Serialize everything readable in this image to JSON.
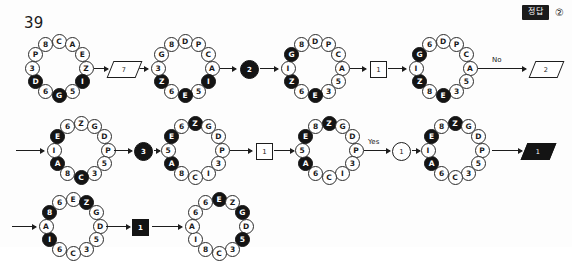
{
  "page": {
    "question_number": "39",
    "answer_badge_label": "정답",
    "answer_choice": "②"
  },
  "colors": {
    "ink": "#1a1a1a",
    "node_fill_dark": "#141414",
    "node_fill_light": "#ffffff",
    "page_background": "#fdfdfd"
  },
  "labels": {
    "branch_no": "No",
    "branch_yes": "Yes"
  },
  "rings": [
    {
      "id": "ring-1",
      "row": 1,
      "x": 26,
      "nodes": [
        {
          "label": "C",
          "filled": false
        },
        {
          "label": "A",
          "filled": false
        },
        {
          "label": "E",
          "filled": false
        },
        {
          "label": "Z",
          "filled": false
        },
        {
          "label": "I",
          "filled": true
        },
        {
          "label": "5",
          "filled": false
        },
        {
          "label": "G",
          "filled": true
        },
        {
          "label": "6",
          "filled": false
        },
        {
          "label": "D",
          "filled": true
        },
        {
          "label": "3",
          "filled": false
        },
        {
          "label": "P",
          "filled": false
        },
        {
          "label": "8",
          "filled": false
        }
      ]
    },
    {
      "id": "ring-2",
      "row": 1,
      "x": 152,
      "nodes": [
        {
          "label": "D",
          "filled": false
        },
        {
          "label": "P",
          "filled": false
        },
        {
          "label": "C",
          "filled": false
        },
        {
          "label": "A",
          "filled": false
        },
        {
          "label": "I",
          "filled": true
        },
        {
          "label": "5",
          "filled": false
        },
        {
          "label": "E",
          "filled": true
        },
        {
          "label": "6",
          "filled": false
        },
        {
          "label": "Z",
          "filled": true
        },
        {
          "label": "3",
          "filled": false
        },
        {
          "label": "G",
          "filled": false
        },
        {
          "label": "8",
          "filled": false
        }
      ]
    },
    {
      "id": "ring-3",
      "row": 1,
      "x": 282,
      "nodes": [
        {
          "label": "D",
          "filled": false
        },
        {
          "label": "P",
          "filled": false
        },
        {
          "label": "C",
          "filled": false
        },
        {
          "label": "A",
          "filled": false
        },
        {
          "label": "5",
          "filled": false
        },
        {
          "label": "3",
          "filled": false
        },
        {
          "label": "E",
          "filled": true
        },
        {
          "label": "6",
          "filled": false
        },
        {
          "label": "Z",
          "filled": true
        },
        {
          "label": "I",
          "filled": false
        },
        {
          "label": "G",
          "filled": true
        },
        {
          "label": "8",
          "filled": false
        }
      ]
    },
    {
      "id": "ring-4",
      "row": 1,
      "x": 410,
      "nodes": [
        {
          "label": "D",
          "filled": false
        },
        {
          "label": "P",
          "filled": false
        },
        {
          "label": "C",
          "filled": false
        },
        {
          "label": "A",
          "filled": false
        },
        {
          "label": "5",
          "filled": false
        },
        {
          "label": "3",
          "filled": false
        },
        {
          "label": "E",
          "filled": true
        },
        {
          "label": "8",
          "filled": false
        },
        {
          "label": "Z",
          "filled": true
        },
        {
          "label": "I",
          "filled": false
        },
        {
          "label": "G",
          "filled": true
        },
        {
          "label": "6",
          "filled": false
        }
      ]
    },
    {
      "id": "ring-5",
      "row": 2,
      "x": 48,
      "nodes": [
        {
          "label": "Z",
          "filled": false
        },
        {
          "label": "G",
          "filled": false
        },
        {
          "label": "D",
          "filled": false
        },
        {
          "label": "P",
          "filled": false
        },
        {
          "label": "5",
          "filled": false
        },
        {
          "label": "3",
          "filled": false
        },
        {
          "label": "C",
          "filled": true
        },
        {
          "label": "8",
          "filled": false
        },
        {
          "label": "A",
          "filled": true
        },
        {
          "label": "I",
          "filled": false
        },
        {
          "label": "E",
          "filled": true
        },
        {
          "label": "6",
          "filled": false
        }
      ]
    },
    {
      "id": "ring-6",
      "row": 2,
      "x": 162,
      "nodes": [
        {
          "label": "Z",
          "filled": true
        },
        {
          "label": "G",
          "filled": false
        },
        {
          "label": "D",
          "filled": false
        },
        {
          "label": "P",
          "filled": false
        },
        {
          "label": "3",
          "filled": false
        },
        {
          "label": "I",
          "filled": false
        },
        {
          "label": "C",
          "filled": false
        },
        {
          "label": "8",
          "filled": false
        },
        {
          "label": "A",
          "filled": true
        },
        {
          "label": "5",
          "filled": false
        },
        {
          "label": "E",
          "filled": true
        },
        {
          "label": "6",
          "filled": false
        }
      ]
    },
    {
      "id": "ring-7",
      "row": 2,
      "x": 296,
      "nodes": [
        {
          "label": "Z",
          "filled": true
        },
        {
          "label": "G",
          "filled": false
        },
        {
          "label": "D",
          "filled": false
        },
        {
          "label": "P",
          "filled": false
        },
        {
          "label": "3",
          "filled": false
        },
        {
          "label": "I",
          "filled": false
        },
        {
          "label": "C",
          "filled": false
        },
        {
          "label": "6",
          "filled": false
        },
        {
          "label": "A",
          "filled": true
        },
        {
          "label": "5",
          "filled": false
        },
        {
          "label": "E",
          "filled": true
        },
        {
          "label": "8",
          "filled": false
        }
      ]
    },
    {
      "id": "ring-8",
      "row": 2,
      "x": 422,
      "nodes": [
        {
          "label": "Z",
          "filled": true
        },
        {
          "label": "G",
          "filled": false
        },
        {
          "label": "D",
          "filled": false
        },
        {
          "label": "P",
          "filled": false
        },
        {
          "label": "5",
          "filled": false
        },
        {
          "label": "3",
          "filled": false
        },
        {
          "label": "C",
          "filled": false
        },
        {
          "label": "6",
          "filled": false
        },
        {
          "label": "A",
          "filled": true
        },
        {
          "label": "I",
          "filled": false
        },
        {
          "label": "E",
          "filled": true
        },
        {
          "label": "8",
          "filled": false
        }
      ]
    },
    {
      "id": "ring-9",
      "row": 3,
      "x": 40,
      "nodes": [
        {
          "label": "E",
          "filled": false
        },
        {
          "label": "Z",
          "filled": true
        },
        {
          "label": "G",
          "filled": false
        },
        {
          "label": "D",
          "filled": false
        },
        {
          "label": "5",
          "filled": false
        },
        {
          "label": "3",
          "filled": false
        },
        {
          "label": "C",
          "filled": false
        },
        {
          "label": "6",
          "filled": false
        },
        {
          "label": "I",
          "filled": true
        },
        {
          "label": "A",
          "filled": false
        },
        {
          "label": "8",
          "filled": true
        },
        {
          "label": "6",
          "filled": false
        }
      ]
    },
    {
      "id": "ring-10",
      "row": 3,
      "x": 186,
      "nodes": [
        {
          "label": "E",
          "filled": true
        },
        {
          "label": "Z",
          "filled": false
        },
        {
          "label": "G",
          "filled": true
        },
        {
          "label": "D",
          "filled": false
        },
        {
          "label": "5",
          "filled": true
        },
        {
          "label": "3",
          "filled": false
        },
        {
          "label": "C",
          "filled": false
        },
        {
          "label": "8",
          "filled": false
        },
        {
          "label": "I",
          "filled": false
        },
        {
          "label": "A",
          "filled": false
        },
        {
          "label": "6",
          "filled": false
        },
        {
          "label": "6",
          "filled": false
        }
      ]
    }
  ],
  "operators": [
    {
      "id": "op-1",
      "row": 1,
      "type": "parallelogram",
      "value": "7",
      "x": 110,
      "solid": false
    },
    {
      "id": "op-2",
      "row": 1,
      "type": "circle-filled",
      "value": "2",
      "x": 240,
      "solid": true
    },
    {
      "id": "op-3",
      "row": 1,
      "type": "square",
      "value": "1",
      "x": 370,
      "solid": false
    },
    {
      "id": "op-4",
      "row": 1,
      "type": "parallelogram",
      "value": "2",
      "x": 532,
      "solid": false
    },
    {
      "id": "op-5",
      "row": 2,
      "type": "circle-filled",
      "value": "3",
      "x": 134,
      "solid": true
    },
    {
      "id": "op-6",
      "row": 2,
      "type": "square",
      "value": "1",
      "x": 256,
      "solid": false
    },
    {
      "id": "op-7",
      "row": 2,
      "type": "circle-open",
      "value": "1",
      "x": 392,
      "solid": false
    },
    {
      "id": "op-8",
      "row": 2,
      "type": "parallelogram",
      "value": "1",
      "x": 524,
      "solid": true
    },
    {
      "id": "op-9",
      "row": 3,
      "type": "square",
      "value": "1",
      "x": 132,
      "solid": true
    }
  ],
  "arrows": [
    {
      "id": "arrow-r1-a",
      "row": 1,
      "x": 94,
      "width": 14
    },
    {
      "id": "arrow-r1-b",
      "row": 1,
      "x": 132,
      "width": 16
    },
    {
      "id": "arrow-r1-c",
      "row": 1,
      "x": 220,
      "width": 16
    },
    {
      "id": "arrow-r1-d",
      "row": 1,
      "x": 260,
      "width": 18
    },
    {
      "id": "arrow-r1-e",
      "row": 1,
      "x": 350,
      "width": 16
    },
    {
      "id": "arrow-r1-f",
      "row": 1,
      "x": 388,
      "width": 18
    },
    {
      "id": "arrow-r1-g",
      "row": 1,
      "x": 478,
      "width": 48
    },
    {
      "id": "arrow-r2-a",
      "row": 2,
      "x": 16,
      "width": 28
    },
    {
      "id": "arrow-r2-b",
      "row": 2,
      "x": 114,
      "width": 18
    },
    {
      "id": "arrow-r2-c",
      "row": 2,
      "x": 154,
      "width": 6
    },
    {
      "id": "arrow-r2-d",
      "row": 2,
      "x": 230,
      "width": 22
    },
    {
      "id": "arrow-r2-e",
      "row": 2,
      "x": 274,
      "width": 20
    },
    {
      "id": "arrow-r2-f",
      "row": 2,
      "x": 364,
      "width": 26
    },
    {
      "id": "arrow-r2-g",
      "row": 2,
      "x": 412,
      "width": 8
    },
    {
      "id": "arrow-r2-h",
      "row": 2,
      "x": 492,
      "width": 30
    },
    {
      "id": "arrow-r3-a",
      "row": 3,
      "x": 12,
      "width": 24
    },
    {
      "id": "arrow-r3-b",
      "row": 3,
      "x": 106,
      "width": 24
    },
    {
      "id": "arrow-r3-c",
      "row": 3,
      "x": 152,
      "width": 30
    }
  ],
  "branches": [
    {
      "id": "branch-no",
      "row": 1,
      "label_key": "branch_no",
      "x": 492
    },
    {
      "id": "branch-yes",
      "row": 2,
      "label_key": "branch_yes",
      "x": 368
    }
  ]
}
